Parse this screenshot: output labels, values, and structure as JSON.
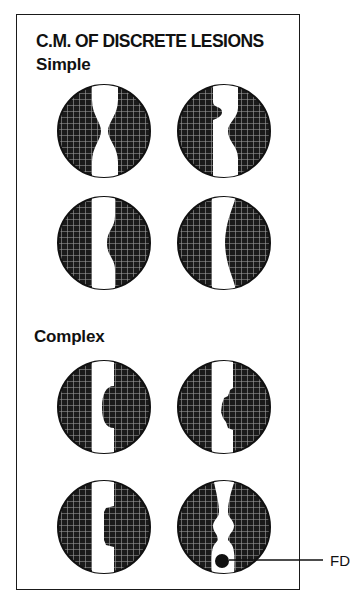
{
  "title": "C.M. OF DISCRETE LESIONS",
  "sections": [
    {
      "label": "Simple",
      "diagrams": [
        "symmetric-stenosis",
        "eccentric-step-stenosis",
        "smooth-bulge-one-wall",
        "tapered-one-wall"
      ]
    },
    {
      "label": "Complex",
      "diagrams": [
        "rounded-intraluminal-mass",
        "irregular-mass",
        "shelf-lesion",
        "double-narrowing-with-filling-defect"
      ]
    }
  ],
  "annotations": [
    {
      "label": "FD",
      "target": "filling-defect"
    }
  ],
  "colors": {
    "fill": "#1a1a1a",
    "lumen": "#ffffff",
    "hatch": "#9a9a9a"
  }
}
